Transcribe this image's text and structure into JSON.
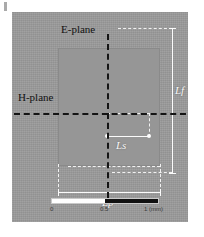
{
  "figure": {
    "type": "photograph-with-dimension-annotations"
  },
  "planes": {
    "e_plane": {
      "label": "E-plane",
      "orientation": "vertical",
      "line_style": "black dash-dot"
    },
    "h_plane": {
      "label": "H-plane",
      "orientation": "horizontal",
      "line_style": "black dash-dot"
    }
  },
  "dimensions": [
    {
      "id": "Lf",
      "label": "Lf",
      "orientation": "vertical",
      "position": "right",
      "line_style": "white solid with dashed extension"
    },
    {
      "id": "Lp",
      "label": "Lp",
      "orientation": "horizontal",
      "position": "bottom",
      "line_style": "white solid with dashed extension"
    },
    {
      "id": "Ls",
      "label": "Ls",
      "orientation": "horizontal",
      "position": "center",
      "line_style": "white solid with dot terminators"
    }
  ],
  "scale_bar": {
    "unit": "mm",
    "ticks": [
      "0",
      "0.5",
      "1 (mm)"
    ],
    "segments": [
      "white",
      "black"
    ],
    "total_length_mm": 1
  },
  "colors": {
    "photo_background": "#9b9b9b",
    "patch": "#969696",
    "plane_line": "#141414",
    "dimension_line": "#f7f7f7",
    "scale_black": "#111111",
    "scale_white": "#ffffff"
  }
}
